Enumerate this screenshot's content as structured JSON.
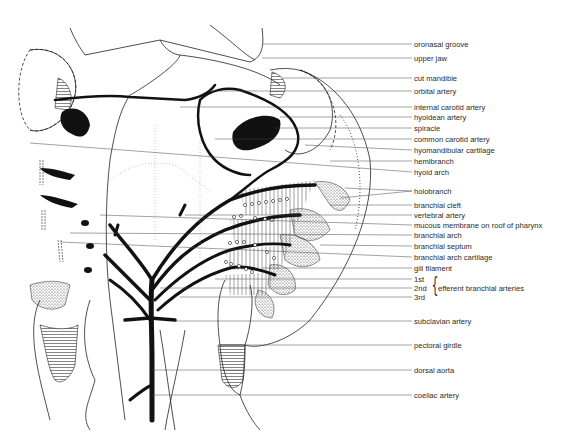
{
  "figure": {
    "type": "anatomical line drawing",
    "colors": {
      "line": "#111111",
      "background": "#ffffff",
      "stipple": "#555555"
    }
  },
  "labels": [
    {
      "id": "oronasal-groove",
      "text": "oronasal groove",
      "y": 44
    },
    {
      "id": "upper-jaw",
      "text": "upper jaw",
      "y": 58
    },
    {
      "id": "cut-mandible",
      "text": "cut mandible",
      "y": 78
    },
    {
      "id": "orbital-artery",
      "text": "orbital artery",
      "y": 91
    },
    {
      "id": "internal-carotid-artery",
      "text": "internal carotid artery",
      "y": 107
    },
    {
      "id": "hyoidean-artery",
      "text": "hyoidean artery",
      "y": 117
    },
    {
      "id": "spiracle",
      "text": "spiracle",
      "y": 128
    },
    {
      "id": "common-carotid-artery",
      "text": "common carotid artery",
      "y": 139
    },
    {
      "id": "hyomandibular-cartilage",
      "text": "hyomandibular cartilage",
      "y": 150
    },
    {
      "id": "hemibranch",
      "text": "hemibranch",
      "y": 161
    },
    {
      "id": "hyoid-arch",
      "text": "hyoid arch",
      "y": 172
    },
    {
      "id": "holobranch",
      "text": "holobranch",
      "y": 191
    },
    {
      "id": "branchial-cleft",
      "text": "branchial cleft",
      "y": 205
    },
    {
      "id": "vertebral-artery",
      "text": "vertebral artery",
      "y": 215
    },
    {
      "id": "mucous-membrane",
      "text": "mucous membrane on roof of pharynx",
      "y": 225
    },
    {
      "id": "branchial-arch",
      "text": "branchial arch",
      "y": 235
    },
    {
      "id": "branchial-septum",
      "text": "branchial septum",
      "y": 246
    },
    {
      "id": "branchial-arch-cartilage",
      "text": "branchial arch cartilage",
      "y": 257
    },
    {
      "id": "gill-filament",
      "text": "gill filament",
      "y": 268
    },
    {
      "id": "first",
      "text": "1st",
      "y": 279
    },
    {
      "id": "second",
      "text": "2nd",
      "y": 288
    },
    {
      "id": "third",
      "text": "3rd",
      "y": 297
    },
    {
      "id": "subclavian-artery",
      "text": "subclavian artery",
      "y": 321
    },
    {
      "id": "pectoral-girdle",
      "text": "pectoral girdle",
      "y": 345
    },
    {
      "id": "dorsal-aorta",
      "text": "dorsal aorta",
      "y": 370
    },
    {
      "id": "coeliac-artery",
      "text": "coeliac artery",
      "y": 395
    }
  ],
  "group_label": {
    "text": "efferent branchial arteries",
    "brace": "{"
  }
}
